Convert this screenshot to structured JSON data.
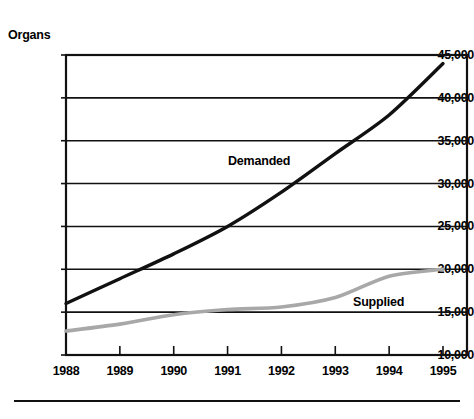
{
  "chart_data": {
    "type": "line",
    "title": "",
    "xlabel": "",
    "ylabel": "Organs",
    "x": [
      1988,
      1989,
      1990,
      1991,
      1992,
      1993,
      1994,
      1995
    ],
    "categories": [
      "1988",
      "1989",
      "1990",
      "1991",
      "1992",
      "1993",
      "1994",
      "1995"
    ],
    "xlim": [
      1988,
      1995
    ],
    "ylim": [
      10000,
      45000
    ],
    "ytick_labels": [
      "45,000",
      "40,000",
      "35,000",
      "30,000",
      "25,000",
      "20,000",
      "15,000",
      "10,000"
    ],
    "ytick_values": [
      45000,
      40000,
      35000,
      30000,
      25000,
      20000,
      15000,
      10000
    ],
    "grid": true,
    "legend_position": "inline-annotation",
    "series": [
      {
        "name": "Demanded",
        "color": "#111111",
        "values": [
          16000,
          18900,
          21800,
          25000,
          29000,
          33500,
          38000,
          44000
        ]
      },
      {
        "name": "Supplied",
        "color": "#a8a8a8",
        "values": [
          12800,
          13600,
          14700,
          15300,
          15600,
          16700,
          19200,
          20000
        ]
      }
    ],
    "annotations": [
      {
        "text": "Demanded",
        "series": "Demanded"
      },
      {
        "text": "Supplied",
        "series": "Supplied"
      }
    ]
  },
  "axis": {
    "y_title": "Organs"
  }
}
